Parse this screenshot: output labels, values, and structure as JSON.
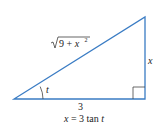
{
  "diagram": {
    "type": "right-triangle",
    "line_color": "#3a7cc4",
    "text_color": "#222222",
    "vertices": {
      "angle_vertex": [
        14,
        99
      ],
      "right_angle_vertex": [
        145,
        99
      ],
      "top_vertex": [
        145,
        17
      ]
    },
    "labels": {
      "hypotenuse": "√9 + x²",
      "hyp_radicand": "9 + x",
      "hyp_exponent": "2",
      "opposite": "x",
      "adjacent": "3",
      "angle": "t",
      "equation": "x = 3 tan t"
    }
  }
}
